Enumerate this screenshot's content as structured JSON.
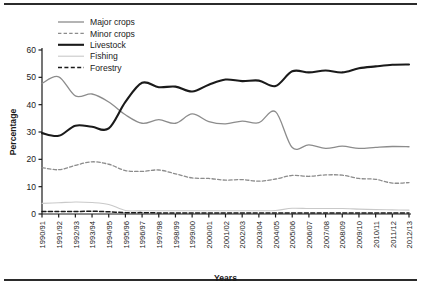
{
  "chart_data": {
    "type": "line",
    "title": "",
    "xlabel": "Years",
    "ylabel": "Percentage",
    "ylim": [
      0,
      60
    ],
    "yticks": [
      0,
      10,
      20,
      30,
      40,
      50,
      60
    ],
    "grid": false,
    "legend_position": "top-left",
    "categories": [
      "1990/91",
      "1991/92",
      "1992/93",
      "1993/94",
      "1994/95",
      "1995/96",
      "1996/97",
      "1997/98",
      "1998/99",
      "1999/00",
      "2000/01",
      "2001/02",
      "2002/03",
      "2003/04",
      "2004/05",
      "2005/06",
      "2006/07",
      "2007/08",
      "2008/09",
      "2009/10",
      "2010/11",
      "2011/12",
      "2012/13"
    ],
    "series": [
      {
        "name": "Major crops",
        "style": "solid",
        "color": "#8c8c8c",
        "width": 1.3,
        "values": [
          47.8,
          50.2,
          43.2,
          43.9,
          41.0,
          36.3,
          33.2,
          34.5,
          33.2,
          36.6,
          33.8,
          33.0,
          34.0,
          33.4,
          37.4,
          24.3,
          25.3,
          24.0,
          24.8,
          24.0,
          24.4,
          24.7,
          24.6
        ]
      },
      {
        "name": "Minor crops",
        "style": "dashed",
        "color": "#8c8c8c",
        "width": 1.3,
        "values": [
          17.0,
          16.2,
          17.8,
          19.1,
          18.2,
          15.9,
          15.6,
          16.1,
          14.7,
          13.2,
          13.0,
          12.4,
          12.6,
          12.0,
          12.8,
          14.1,
          13.8,
          14.3,
          14.2,
          13.0,
          12.7,
          11.3,
          11.5
        ]
      },
      {
        "name": "Livestock",
        "style": "solid",
        "color": "#1a1a1a",
        "width": 2.1,
        "values": [
          29.6,
          28.6,
          32.3,
          31.9,
          31.3,
          41.0,
          48.0,
          46.4,
          46.6,
          44.8,
          47.3,
          49.2,
          48.6,
          48.8,
          46.8,
          52.2,
          51.8,
          52.5,
          51.8,
          53.3,
          54.0,
          54.6,
          54.7
        ]
      },
      {
        "name": "Fishing",
        "style": "solid",
        "color": "#c9c9c9",
        "width": 1.1,
        "values": [
          3.9,
          4.1,
          4.4,
          4.2,
          3.5,
          1.3,
          1.2,
          1.2,
          1.2,
          1.2,
          1.2,
          1.2,
          1.2,
          1.2,
          1.3,
          2.1,
          2.0,
          2.0,
          2.0,
          1.8,
          1.6,
          1.5,
          1.4
        ]
      },
      {
        "name": "Forestry",
        "style": "dashed",
        "color": "#1a1a1a",
        "width": 1.5,
        "values": [
          0.9,
          0.9,
          0.9,
          1.0,
          0.8,
          0.5,
          0.5,
          0.4,
          0.4,
          0.4,
          0.4,
          0.4,
          0.4,
          0.4,
          0.4,
          0.4,
          0.4,
          0.4,
          0.4,
          0.4,
          0.4,
          0.4,
          0.4
        ]
      }
    ]
  },
  "legend": {
    "items": [
      {
        "label": "Major crops"
      },
      {
        "label": "Minor crops"
      },
      {
        "label": "Livestock"
      },
      {
        "label": "Fishing"
      },
      {
        "label": "Forestry"
      }
    ]
  }
}
